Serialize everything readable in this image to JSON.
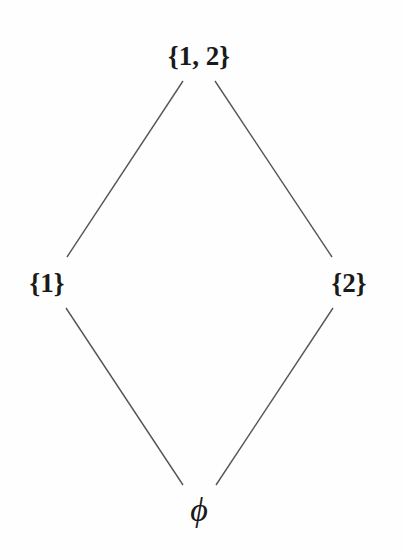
{
  "diagram": {
    "type": "hasse-diagram",
    "line_color": "#555555",
    "text_color": "#1a1a1a",
    "nodes": [
      {
        "id": "top",
        "label": "{1, 2}",
        "x": 199,
        "y": 56
      },
      {
        "id": "left",
        "label": "{1}",
        "x": 47,
        "y": 283
      },
      {
        "id": "right",
        "label": "{2}",
        "x": 349,
        "y": 283
      },
      {
        "id": "bottom",
        "label": "ϕ",
        "x": 199,
        "y": 510
      }
    ],
    "edges": [
      {
        "from": "top",
        "to": "left",
        "x1": 183,
        "y1": 81,
        "x2": 67,
        "y2": 257
      },
      {
        "from": "top",
        "to": "right",
        "x1": 215,
        "y1": 81,
        "x2": 332,
        "y2": 257
      },
      {
        "from": "left",
        "to": "bottom",
        "x1": 66,
        "y1": 308,
        "x2": 183,
        "y2": 485
      },
      {
        "from": "right",
        "to": "bottom",
        "x1": 333,
        "y1": 308,
        "x2": 216,
        "y2": 485
      }
    ]
  }
}
